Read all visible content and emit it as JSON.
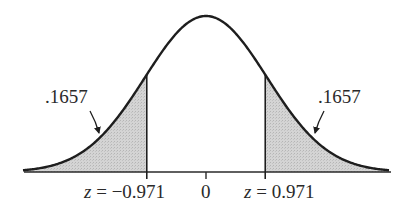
{
  "chart_data": {
    "type": "area",
    "title": "",
    "subtitle": "",
    "xlabel": "z",
    "ylabel": "",
    "distribution": "standard normal",
    "mean": 0,
    "sd": 1,
    "xlim": [
      -3,
      3
    ],
    "grid": false,
    "legend": null,
    "shaded_regions": [
      {
        "name": "left tail",
        "from": -3,
        "to": -0.971,
        "area": 0.1657,
        "label": ".1657"
      },
      {
        "name": "right tail",
        "from": 0.971,
        "to": 3,
        "area": 0.1657,
        "label": ".1657"
      }
    ],
    "ticks": [
      {
        "value": -0.971,
        "label_var": "z",
        "label_eq": " = ",
        "label_num": "−0.971"
      },
      {
        "value": 0,
        "label_var": "",
        "label_eq": "",
        "label_num": "0"
      },
      {
        "value": 0.971,
        "label_var": "z",
        "label_eq": " = ",
        "label_num": "0.971"
      }
    ],
    "annotations": [
      ".1657",
      ".1657"
    ]
  },
  "colors": {
    "curve": "#1e1e1e",
    "shade": "#cfcfcf",
    "axis": "#2a2a2a",
    "text": "#2a2a2a"
  },
  "labels": {
    "left_area": ".1657",
    "right_area": ".1657",
    "left_z_var": "z",
    "left_z_eq": " = ",
    "left_z_num": "−0.971",
    "center": "0",
    "right_z_var": "z",
    "right_z_eq": " = ",
    "right_z_num": "0.971"
  }
}
